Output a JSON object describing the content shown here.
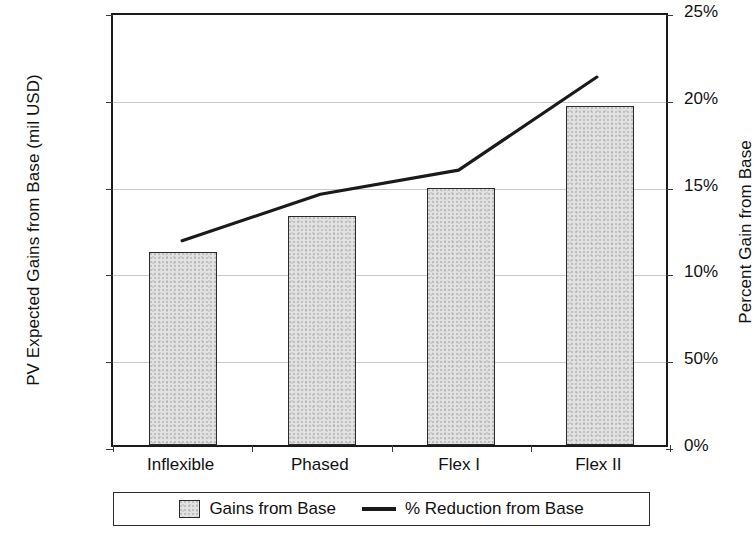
{
  "chart_data": {
    "type": "bar",
    "title": "",
    "subtitle": "",
    "xlabel": "",
    "ylabel": "PV Expected Gains from Base (mil USD)",
    "y2label": "Percent Gain from Base",
    "categories": [
      "Inflexible",
      "Phased",
      "Flex I",
      "Flex II"
    ],
    "ylim": [
      0,
      250
    ],
    "y2lim": [
      0,
      25
    ],
    "yticks": [
      0,
      50,
      100,
      150,
      200,
      250
    ],
    "ytick_labels": [
      "$0",
      "$50",
      "$100",
      "$150",
      "$200",
      "$250"
    ],
    "y2ticks": [
      0,
      5,
      10,
      15,
      20,
      25
    ],
    "y2tick_labels": [
      "0%",
      "50%",
      "10%",
      "15%",
      "20%",
      "25%"
    ],
    "grid": true,
    "legend_position": "bottom",
    "series": [
      {
        "name": "Gains from Base",
        "type": "bar",
        "axis": "left",
        "unit": "mil USD",
        "values": [
          111,
          132,
          148,
          195
        ]
      },
      {
        "name": "% Reduction from Base",
        "type": "line",
        "axis": "right",
        "unit": "%",
        "values": [
          11.9,
          14.6,
          16.0,
          21.4
        ]
      }
    ]
  },
  "legend": {
    "bar_label": "Gains from Base",
    "line_label": "% Reduction from Base"
  }
}
